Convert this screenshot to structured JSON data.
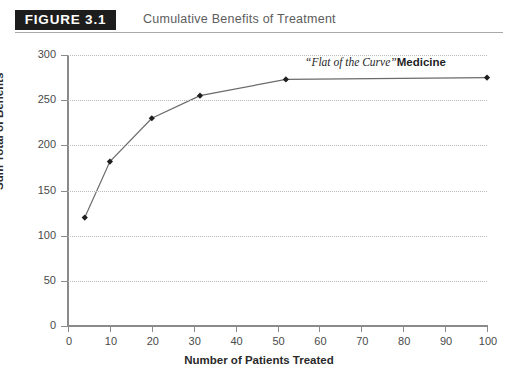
{
  "figure": {
    "badge_label": "FIGURE 3.1",
    "caption": "Cumulative Benefits of Treatment"
  },
  "colors": {
    "badge_background": "#1d1d1d",
    "badge_text": "#ffffff",
    "caption_text": "#5d5d5d",
    "axis": "#8a8a8a",
    "gridline": "#b9b9b9",
    "series_line": "#6b6b6b",
    "marker": "#1f1f1f",
    "annotation_text": "#1f1f1f"
  },
  "chart_data": {
    "type": "line",
    "title": "Cumulative Benefits of Treatment",
    "xlabel": "Number of Patients Treated",
    "ylabel": "Sum Total of Benefits",
    "xlim": [
      0,
      100
    ],
    "ylim": [
      0,
      300
    ],
    "xticks": [
      0,
      10,
      20,
      30,
      40,
      50,
      60,
      70,
      80,
      90,
      100
    ],
    "yticks": [
      0,
      50,
      100,
      150,
      200,
      250,
      300
    ],
    "grid": "horizontal-dotted",
    "legend": "none",
    "markers": "filled-diamond",
    "series": [
      {
        "name": "Cumulative benefits",
        "x": [
          4,
          10,
          20,
          31.5,
          52,
          100
        ],
        "y": [
          120,
          182,
          230,
          255,
          273,
          275
        ]
      }
    ],
    "annotations": [
      {
        "quoted_text": "“Flat of the Curve”",
        "emphasis_text": "Medicine",
        "x": 62,
        "y": 292
      }
    ]
  }
}
